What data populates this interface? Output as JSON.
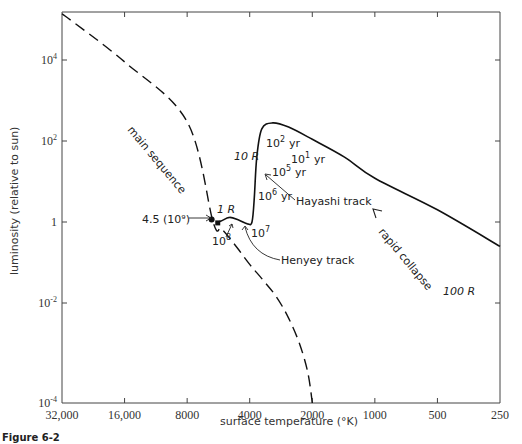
{
  "chart_data": {
    "type": "line",
    "title": "",
    "caption": "Figure 6-2",
    "xlabel": "surface temperature (°K)",
    "ylabel": "luminosity (relative to sun)",
    "x_scale": "log",
    "x_reversed": true,
    "y_scale": "log",
    "xlim": [
      32000,
      250
    ],
    "ylim": [
      0.0001,
      200000
    ],
    "x_ticks": [
      {
        "value": 32000,
        "label": "32,000"
      },
      {
        "value": 16000,
        "label": "16,000"
      },
      {
        "value": 8000,
        "label": "8000"
      },
      {
        "value": 4000,
        "label": "4000"
      },
      {
        "value": 2000,
        "label": "2000"
      },
      {
        "value": 1000,
        "label": "1000"
      },
      {
        "value": 500,
        "label": "500"
      },
      {
        "value": 250,
        "label": "250"
      }
    ],
    "y_ticks": [
      {
        "value": 0.0001,
        "base": "10",
        "exp": "-4"
      },
      {
        "value": 0.01,
        "base": "10",
        "exp": "-2"
      },
      {
        "value": 1,
        "base": "1",
        "exp": ""
      },
      {
        "value": 100,
        "base": "10",
        "exp": "2"
      },
      {
        "value": 10000,
        "base": "10",
        "exp": "4"
      }
    ],
    "grid": false,
    "series": [
      {
        "name": "main sequence",
        "style": "dashed",
        "points": [
          [
            32000,
            180000
          ],
          [
            16000,
            9000
          ],
          [
            8000,
            300
          ],
          [
            6000,
            1.0
          ],
          [
            5500,
            0.7
          ],
          [
            5000,
            0.4
          ],
          [
            4500,
            0.2
          ],
          [
            4000,
            0.09
          ],
          [
            3500,
            0.04
          ],
          [
            3000,
            0.015
          ],
          [
            2600,
            0.005
          ],
          [
            2300,
            0.0015
          ],
          [
            2100,
            0.0004
          ],
          [
            2000,
            0.0001
          ]
        ]
      },
      {
        "name": "pre-main-sequence track",
        "style": "solid",
        "points": [
          [
            250,
            0.25
          ],
          [
            500,
            2.0
          ],
          [
            1000,
            12
          ],
          [
            1400,
            40
          ],
          [
            2000,
            110
          ],
          [
            2600,
            220
          ],
          [
            3100,
            280
          ],
          [
            3500,
            200
          ],
          [
            3700,
            40
          ],
          [
            3800,
            4
          ],
          [
            3900,
            1.0
          ],
          [
            4100,
            0.9
          ],
          [
            4500,
            1.1
          ],
          [
            5000,
            1.3
          ],
          [
            5500,
            1.05
          ],
          [
            5800,
            0.95
          ]
        ]
      }
    ],
    "markers": [
      {
        "label": "4.5 (10⁹)",
        "T": 6100,
        "L": 1.15
      },
      {
        "label": "10⁸",
        "T": 5700,
        "L": 0.95
      }
    ],
    "annotations": [
      {
        "id": "main-sequence",
        "text": "main sequence"
      },
      {
        "id": "radius-1",
        "text": "1 R"
      },
      {
        "id": "radius-10",
        "text": "10 R"
      },
      {
        "id": "radius-100",
        "text": "100 R"
      },
      {
        "id": "age-sun",
        "text": "4.5 (10⁹)"
      },
      {
        "id": "age-1e8",
        "base": "10",
        "exp": "8"
      },
      {
        "id": "age-1e7",
        "base": "10",
        "exp": "7"
      },
      {
        "id": "age-1e6",
        "base": "10",
        "exp": "6",
        "unit": "yr"
      },
      {
        "id": "age-1e5",
        "base": "10",
        "exp": "5",
        "unit": "yr"
      },
      {
        "id": "age-1e2",
        "base": "10",
        "exp": "2",
        "unit": "yr"
      },
      {
        "id": "age-1e1",
        "base": "10",
        "exp": "1",
        "unit": "yr"
      },
      {
        "id": "hayashi",
        "text": "Hayashi track"
      },
      {
        "id": "henyey",
        "text": "Henyey track"
      },
      {
        "id": "rapid-collapse",
        "text": "rapid collapse"
      }
    ]
  }
}
